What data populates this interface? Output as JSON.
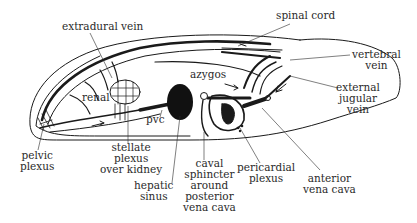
{
  "diagram": {
    "type": "anatomical-line-drawing",
    "colors": {
      "ink": "#1a1a1a",
      "background": "#ffffff",
      "label": "#2a2a2a"
    },
    "labels": {
      "extradural_vein": "extradural vein",
      "spinal_cord": "spinal cord",
      "vertebral_vein": "vertebral\nvein",
      "azygos": "azygos",
      "renal": "renal",
      "pvc": "pvc",
      "external_jugular_vein": "external\njugular\nvein",
      "pelvic_plexus": "pelvic\nplexus",
      "stellate_plexus": "stellate\nplexus\nover kidney",
      "hepatic_sinus": "hepatic\nsinus",
      "caval_sphincter": "caval\nsphincter\naround\nposterior\nvena cava",
      "pericardial_plexus": "pericardial\nplexus",
      "anterior_vena_cava": "anterior\nvena cava"
    }
  }
}
